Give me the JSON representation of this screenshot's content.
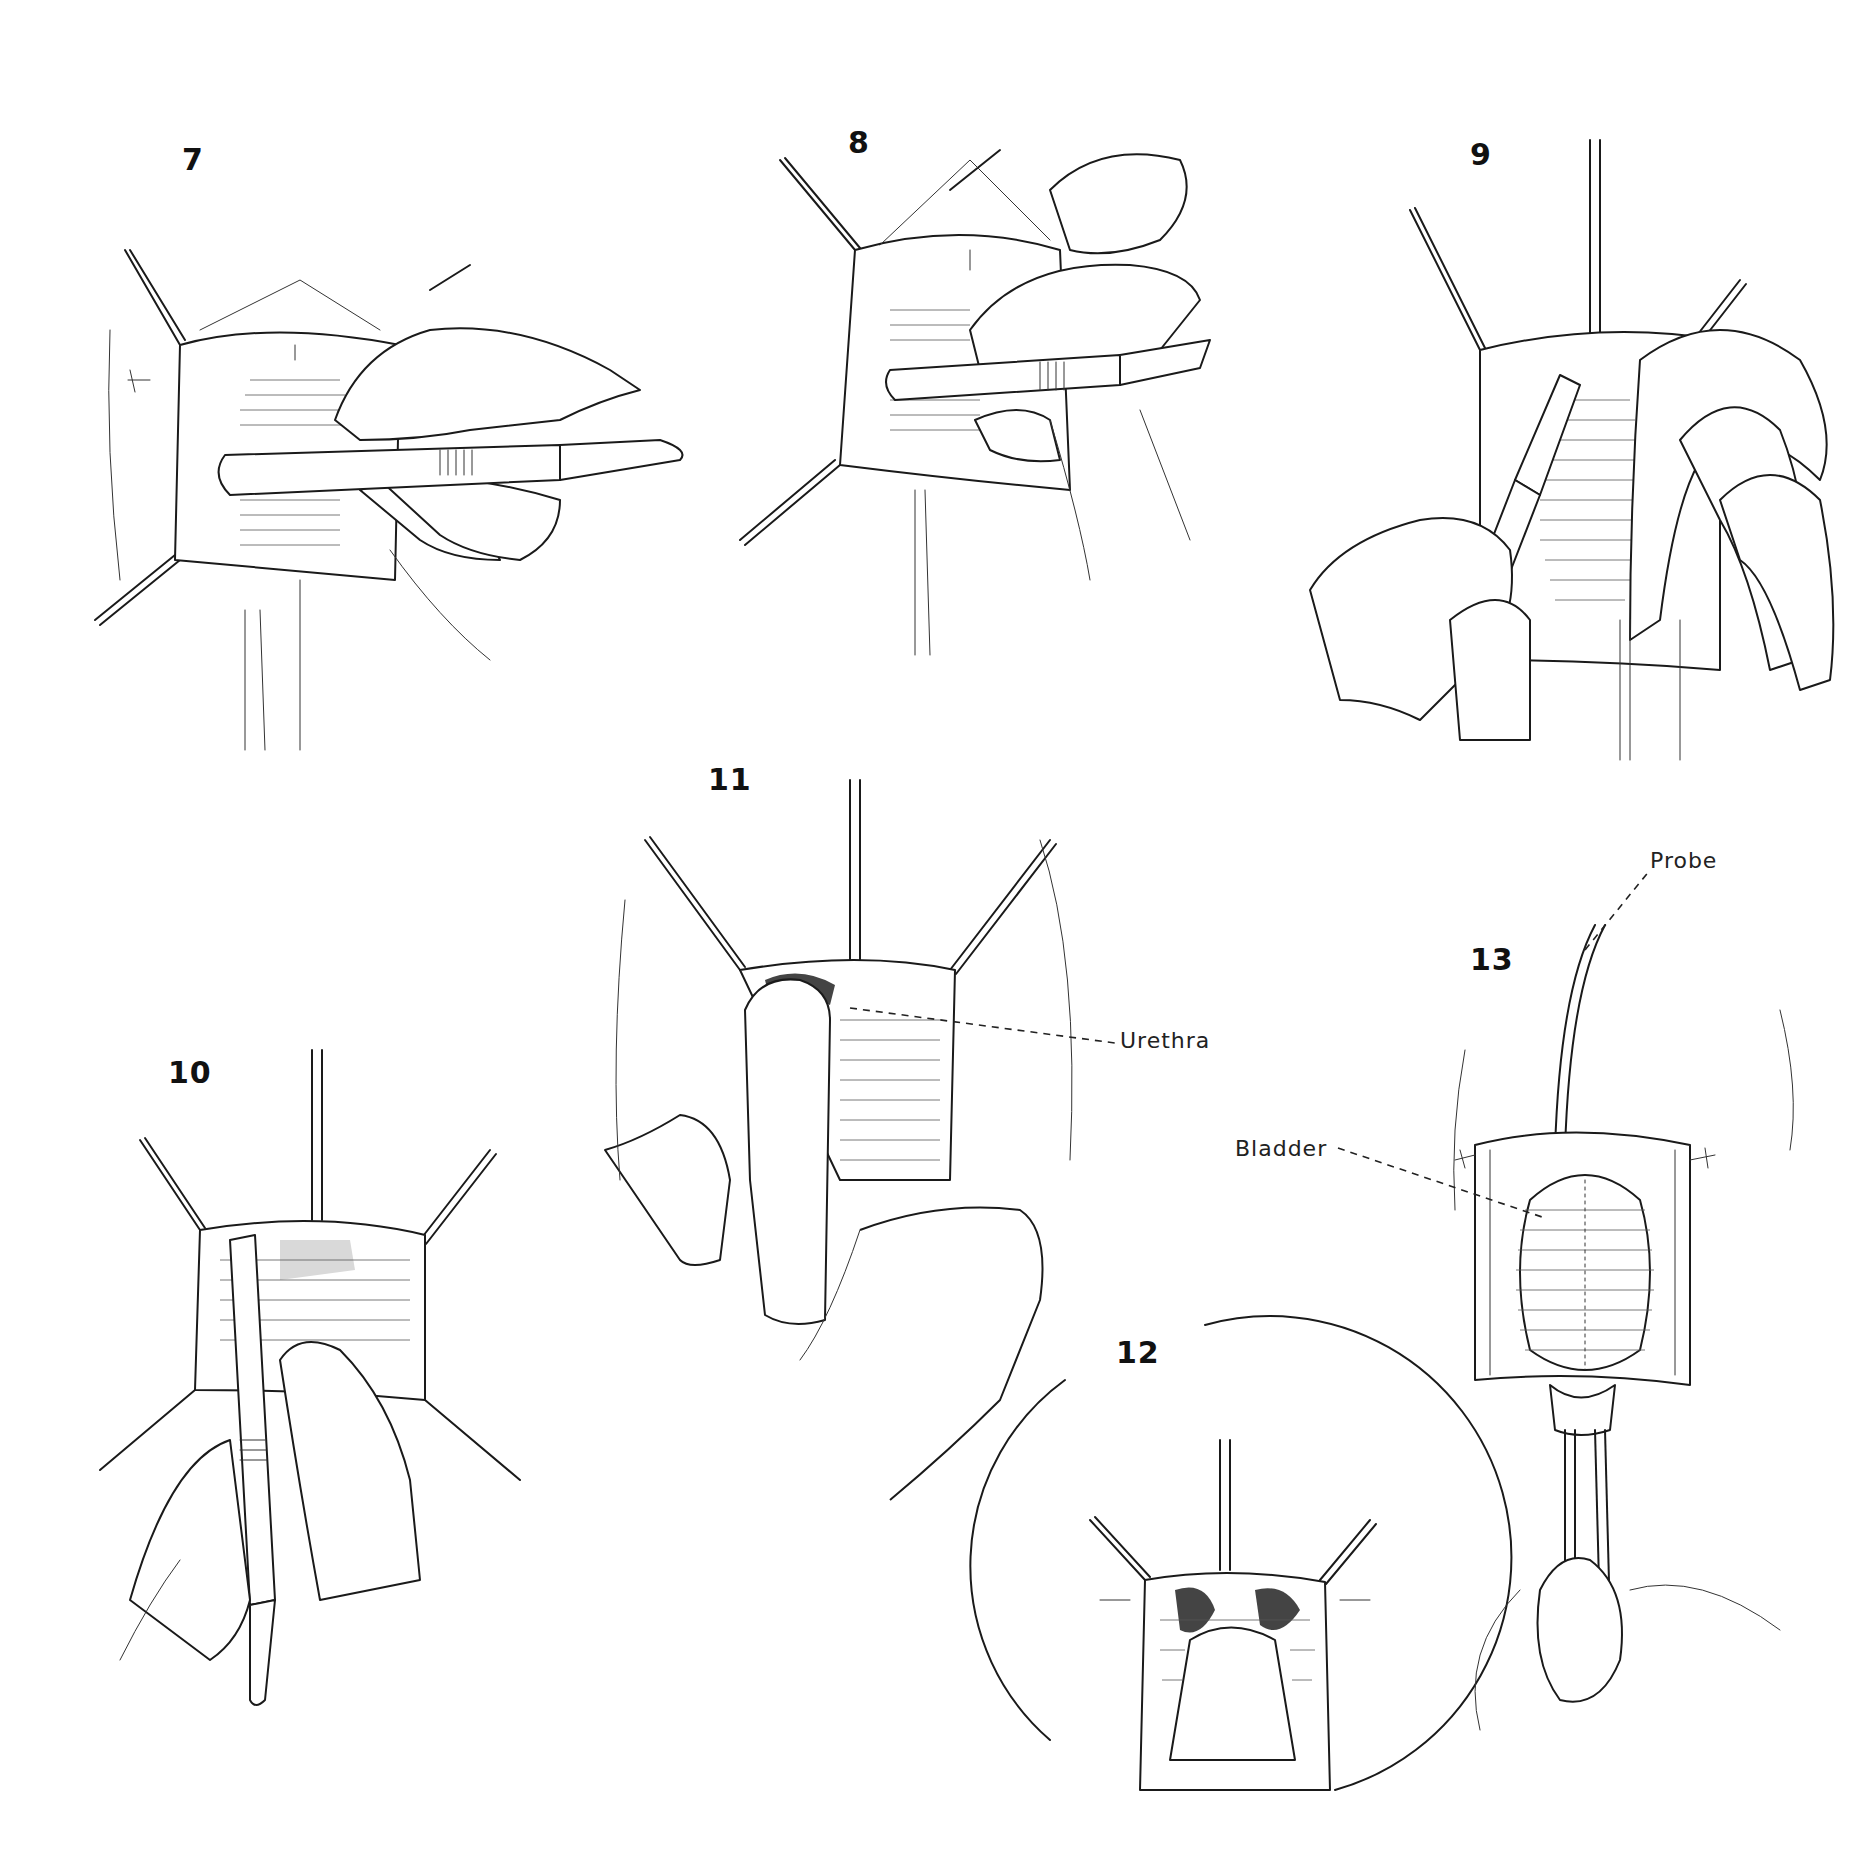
{
  "figure": {
    "background": "#ffffff",
    "ink_color": "#111111",
    "panels": [
      {
        "id": "7",
        "number": "7",
        "number_pos": [
          182,
          145
        ],
        "box": [
          95,
          215,
          620,
          535
        ],
        "depicts": "retracted incision; scalpel held horizontally by hand"
      },
      {
        "id": "8",
        "number": "8",
        "number_pos": [
          848,
          128
        ],
        "box": [
          740,
          120,
          560,
          530
        ],
        "depicts": "scalpel incising with hand from right"
      },
      {
        "id": "9",
        "number": "9",
        "number_pos": [
          1470,
          140
        ],
        "box": [
          1315,
          140,
          560,
          620
        ],
        "depicts": "scalpel held diagonally; finger retracting tissue"
      },
      {
        "id": "10",
        "number": "10",
        "number_pos": [
          168,
          1055
        ],
        "box": [
          100,
          1050,
          430,
          660
        ],
        "depicts": "scalpel held vertically by hand"
      },
      {
        "id": "11",
        "number": "11",
        "number_pos": [
          708,
          765
        ],
        "box": [
          610,
          770,
          450,
          600
        ],
        "depicts": "finger inserted beside urethra"
      },
      {
        "id": "12",
        "number": "12",
        "number_pos": [
          1116,
          1338
        ],
        "box": [
          996,
          1320,
          452,
          452
        ],
        "depicts": "circular close-up view of opened tissue"
      },
      {
        "id": "13",
        "number": "13",
        "number_pos": [
          1460,
          940
        ],
        "box": [
          1410,
          860,
          440,
          870
        ],
        "depicts": "bladder exposed, probe inserted, forceps below"
      }
    ],
    "annotations": [
      {
        "text": "Urethra",
        "pos": [
          1120,
          1025
        ],
        "leader": "dashed"
      },
      {
        "text": "Bladder",
        "pos": [
          1233,
          1138
        ],
        "leader": "dashed"
      },
      {
        "text": "Probe",
        "pos": [
          1650,
          850
        ],
        "leader": "dashed"
      }
    ]
  }
}
